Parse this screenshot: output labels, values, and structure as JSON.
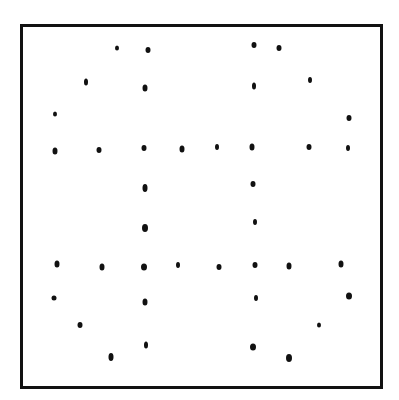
{
  "diagram": {
    "colors": {
      "background": "#ffffff",
      "ink": "#111111"
    },
    "frame": {
      "x": 20,
      "y": 24,
      "width": 363,
      "height": 365,
      "stroke": 3
    },
    "dots": [
      {
        "x": 117,
        "y": 48,
        "w": 4,
        "h": 5
      },
      {
        "x": 148,
        "y": 50,
        "w": 5,
        "h": 6
      },
      {
        "x": 254,
        "y": 45,
        "w": 5,
        "h": 6
      },
      {
        "x": 279,
        "y": 48,
        "w": 5,
        "h": 6
      },
      {
        "x": 86,
        "y": 82,
        "w": 4,
        "h": 7
      },
      {
        "x": 145,
        "y": 88,
        "w": 5,
        "h": 7
      },
      {
        "x": 254,
        "y": 86,
        "w": 4,
        "h": 7
      },
      {
        "x": 310,
        "y": 80,
        "w": 4,
        "h": 6
      },
      {
        "x": 55,
        "y": 114,
        "w": 4,
        "h": 5
      },
      {
        "x": 349,
        "y": 118,
        "w": 5,
        "h": 6
      },
      {
        "x": 55,
        "y": 151,
        "w": 5,
        "h": 7
      },
      {
        "x": 99,
        "y": 150,
        "w": 5,
        "h": 6
      },
      {
        "x": 144,
        "y": 148,
        "w": 5,
        "h": 6
      },
      {
        "x": 182,
        "y": 149,
        "w": 5,
        "h": 7
      },
      {
        "x": 217,
        "y": 147,
        "w": 4,
        "h": 6
      },
      {
        "x": 252,
        "y": 147,
        "w": 5,
        "h": 7
      },
      {
        "x": 309,
        "y": 147,
        "w": 5,
        "h": 6
      },
      {
        "x": 348,
        "y": 148,
        "w": 4,
        "h": 6
      },
      {
        "x": 145,
        "y": 188,
        "w": 5,
        "h": 8
      },
      {
        "x": 253,
        "y": 184,
        "w": 5,
        "h": 6
      },
      {
        "x": 145,
        "y": 228,
        "w": 6,
        "h": 8
      },
      {
        "x": 255,
        "y": 222,
        "w": 4,
        "h": 6
      },
      {
        "x": 57,
        "y": 264,
        "w": 5,
        "h": 7
      },
      {
        "x": 102,
        "y": 267,
        "w": 5,
        "h": 7
      },
      {
        "x": 144,
        "y": 267,
        "w": 6,
        "h": 7
      },
      {
        "x": 178,
        "y": 265,
        "w": 4,
        "h": 6
      },
      {
        "x": 219,
        "y": 267,
        "w": 5,
        "h": 6
      },
      {
        "x": 255,
        "y": 265,
        "w": 5,
        "h": 6
      },
      {
        "x": 289,
        "y": 266,
        "w": 5,
        "h": 7
      },
      {
        "x": 341,
        "y": 264,
        "w": 5,
        "h": 7
      },
      {
        "x": 54,
        "y": 298,
        "w": 5,
        "h": 5
      },
      {
        "x": 145,
        "y": 302,
        "w": 5,
        "h": 7
      },
      {
        "x": 256,
        "y": 298,
        "w": 4,
        "h": 6
      },
      {
        "x": 349,
        "y": 296,
        "w": 6,
        "h": 7
      },
      {
        "x": 80,
        "y": 325,
        "w": 5,
        "h": 6
      },
      {
        "x": 319,
        "y": 325,
        "w": 4,
        "h": 5
      },
      {
        "x": 146,
        "y": 345,
        "w": 4,
        "h": 7
      },
      {
        "x": 253,
        "y": 347,
        "w": 6,
        "h": 7
      },
      {
        "x": 111,
        "y": 357,
        "w": 5,
        "h": 8
      },
      {
        "x": 289,
        "y": 358,
        "w": 6,
        "h": 8
      }
    ]
  }
}
